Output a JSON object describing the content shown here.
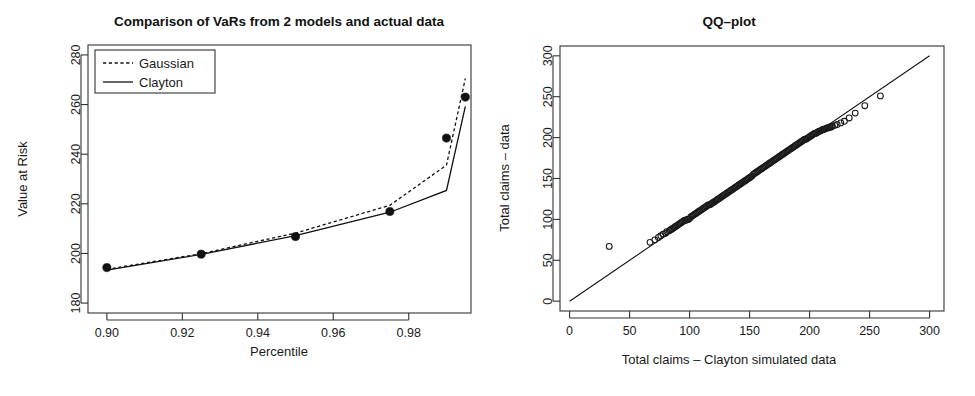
{
  "figure": {
    "background": "#ffffff",
    "ink_color": "#111111",
    "panel_count": 2
  },
  "chart_data": [
    {
      "id": "var-comparison",
      "type": "line",
      "title": "Comparison of VaRs from 2 models and actual data",
      "xlabel": "Percentile",
      "ylabel": "Value at Risk",
      "xlim": [
        0.895,
        0.9965
      ],
      "ylim": [
        176,
        284
      ],
      "xticks": [
        0.9,
        0.92,
        0.94,
        0.96,
        0.98
      ],
      "xtick_labels": [
        "0.90",
        "0.92",
        "0.94",
        "0.96",
        "0.98"
      ],
      "yticks": [
        180,
        200,
        220,
        240,
        260,
        280
      ],
      "ytick_labels": [
        "180",
        "200",
        "220",
        "240",
        "260",
        "280"
      ],
      "grid": false,
      "legend_position": "top-left",
      "x": [
        0.9,
        0.925,
        0.95,
        0.975,
        0.99,
        0.995
      ],
      "series": [
        {
          "name": "Gaussian",
          "style": "dashed",
          "values": [
            193.6,
            199.9,
            208.2,
            219.4,
            235.6,
            270.5
          ]
        },
        {
          "name": "Clayton",
          "style": "solid",
          "values": [
            193.3,
            199.6,
            207.2,
            216.6,
            225.4,
            259.3
          ]
        },
        {
          "name": "Actual data",
          "style": "points",
          "values": [
            194.3,
            199.7,
            206.8,
            216.9,
            246.5,
            263.0
          ]
        }
      ]
    },
    {
      "id": "qq-plot",
      "type": "scatter",
      "title": "QQ–plot",
      "xlabel": "Total claims – Clayton simulated data",
      "ylabel": "Total claims – data",
      "xlim": [
        -8,
        312
      ],
      "ylim": [
        -12,
        312
      ],
      "xticks": [
        0,
        50,
        100,
        150,
        200,
        250,
        300
      ],
      "xtick_labels": [
        "0",
        "50",
        "100",
        "150",
        "200",
        "250",
        "300"
      ],
      "yticks": [
        0,
        50,
        100,
        150,
        200,
        250,
        300
      ],
      "ytick_labels": [
        "0",
        "50",
        "100",
        "150",
        "200",
        "250",
        "300"
      ],
      "grid": false,
      "reference_line": {
        "from": [
          0,
          0
        ],
        "to": [
          300,
          300
        ],
        "style": "solid"
      },
      "marker": "open-circle",
      "points": [
        [
          33,
          67
        ],
        [
          67,
          72
        ],
        [
          71,
          75
        ],
        [
          74,
          78
        ],
        [
          76,
          80
        ],
        [
          78,
          82
        ],
        [
          80,
          83
        ],
        [
          81,
          85
        ],
        [
          83,
          86
        ],
        [
          84,
          87
        ],
        [
          85,
          88
        ],
        [
          86,
          89
        ],
        [
          87,
          90
        ],
        [
          88,
          91
        ],
        [
          89,
          92
        ],
        [
          90,
          93
        ],
        [
          91,
          94
        ],
        [
          92,
          95
        ],
        [
          93,
          96
        ],
        [
          94,
          97
        ],
        [
          95,
          98
        ],
        [
          96,
          99
        ],
        [
          97,
          99
        ],
        [
          98,
          100
        ],
        [
          99,
          100
        ],
        [
          100,
          101
        ],
        [
          101,
          103
        ],
        [
          102,
          104
        ],
        [
          103,
          105
        ],
        [
          104,
          106
        ],
        [
          105,
          107
        ],
        [
          106,
          108
        ],
        [
          107,
          109
        ],
        [
          108,
          110
        ],
        [
          109,
          111
        ],
        [
          110,
          112
        ],
        [
          111,
          113
        ],
        [
          112,
          114
        ],
        [
          113,
          115
        ],
        [
          114,
          116
        ],
        [
          115,
          117
        ],
        [
          116,
          118
        ],
        [
          117,
          118
        ],
        [
          118,
          119
        ],
        [
          119,
          120
        ],
        [
          120,
          121
        ],
        [
          121,
          122
        ],
        [
          122,
          123
        ],
        [
          123,
          124
        ],
        [
          124,
          125
        ],
        [
          125,
          126
        ],
        [
          126,
          127
        ],
        [
          127,
          128
        ],
        [
          128,
          129
        ],
        [
          129,
          130
        ],
        [
          130,
          131
        ],
        [
          131,
          132
        ],
        [
          132,
          133
        ],
        [
          133,
          134
        ],
        [
          134,
          135
        ],
        [
          135,
          136
        ],
        [
          136,
          137
        ],
        [
          137,
          138
        ],
        [
          138,
          139
        ],
        [
          139,
          140
        ],
        [
          140,
          141
        ],
        [
          141,
          142
        ],
        [
          142,
          143
        ],
        [
          143,
          144
        ],
        [
          144,
          145
        ],
        [
          145,
          146
        ],
        [
          146,
          147
        ],
        [
          147,
          148
        ],
        [
          148,
          149
        ],
        [
          149,
          150
        ],
        [
          150,
          151
        ],
        [
          151,
          152
        ],
        [
          152,
          153
        ],
        [
          153,
          155
        ],
        [
          154,
          156
        ],
        [
          155,
          157
        ],
        [
          156,
          158
        ],
        [
          157,
          159
        ],
        [
          158,
          160
        ],
        [
          159,
          161
        ],
        [
          160,
          162
        ],
        [
          161,
          163
        ],
        [
          162,
          164
        ],
        [
          163,
          165
        ],
        [
          164,
          166
        ],
        [
          165,
          167
        ],
        [
          166,
          168
        ],
        [
          167,
          169
        ],
        [
          168,
          170
        ],
        [
          169,
          171
        ],
        [
          170,
          172
        ],
        [
          171,
          173
        ],
        [
          172,
          174
        ],
        [
          173,
          175
        ],
        [
          174,
          176
        ],
        [
          175,
          177
        ],
        [
          176,
          178
        ],
        [
          177,
          179
        ],
        [
          178,
          180
        ],
        [
          179,
          181
        ],
        [
          180,
          182
        ],
        [
          181,
          183
        ],
        [
          182,
          184
        ],
        [
          183,
          185
        ],
        [
          184,
          186
        ],
        [
          185,
          187
        ],
        [
          186,
          188
        ],
        [
          187,
          189
        ],
        [
          188,
          190
        ],
        [
          189,
          191
        ],
        [
          190,
          192
        ],
        [
          191,
          193
        ],
        [
          192,
          194
        ],
        [
          193,
          195
        ],
        [
          194,
          196
        ],
        [
          195,
          197
        ],
        [
          196,
          198
        ],
        [
          197,
          198
        ],
        [
          198,
          199
        ],
        [
          199,
          200
        ],
        [
          200,
          201
        ],
        [
          201,
          202
        ],
        [
          202,
          203
        ],
        [
          203,
          204
        ],
        [
          204,
          205
        ],
        [
          205,
          205
        ],
        [
          206,
          206
        ],
        [
          207,
          207
        ],
        [
          208,
          208
        ],
        [
          209,
          208
        ],
        [
          210,
          209
        ],
        [
          211,
          210
        ],
        [
          212,
          210
        ],
        [
          213,
          211
        ],
        [
          214,
          211
        ],
        [
          215,
          212
        ],
        [
          216,
          212
        ],
        [
          217,
          213
        ],
        [
          218,
          213
        ],
        [
          219,
          214
        ],
        [
          221,
          215
        ],
        [
          223,
          216
        ],
        [
          226,
          218
        ],
        [
          229,
          220
        ],
        [
          233,
          224
        ],
        [
          238,
          230
        ],
        [
          246,
          239
        ],
        [
          259,
          251
        ]
      ],
      "notes": {
        "outlier": [
          33,
          67
        ],
        "dense_band_range": [
          70,
          210
        ],
        "upper_tail_below_line": true
      }
    }
  ],
  "panels": {
    "left": {
      "name": "var-comparison-panel",
      "title": "Comparison of VaRs from 2 models and actual data",
      "xlabel": "Percentile",
      "ylabel": "Value at Risk",
      "legend": {
        "entries": [
          {
            "label": "Gaussian",
            "style": "dashed"
          },
          {
            "label": "Clayton",
            "style": "solid"
          }
        ]
      }
    },
    "right": {
      "name": "qq-plot-panel",
      "title": "QQ–plot",
      "xlabel": "Total claims – Clayton simulated data",
      "ylabel": "Total claims – data"
    }
  }
}
